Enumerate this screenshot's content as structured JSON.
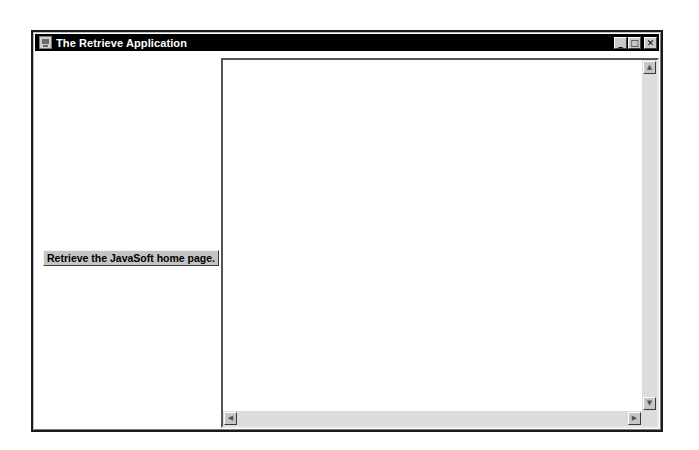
{
  "window": {
    "title": "The Retrieve Application",
    "icon": "java-app-icon",
    "controls": {
      "minimize": "_",
      "maximize": "□",
      "close": "✕"
    }
  },
  "left_pane": {
    "retrieve_button_label": "Retrieve the JavaSoft home page."
  },
  "text_area": {
    "content": "",
    "scrollbar": {
      "up": "▲",
      "down": "▼",
      "left": "◀",
      "right": "▶"
    }
  },
  "colors": {
    "titlebar": "#000000",
    "button_face": "#c4c4c4",
    "scroll_track": "#dcdcdc"
  }
}
